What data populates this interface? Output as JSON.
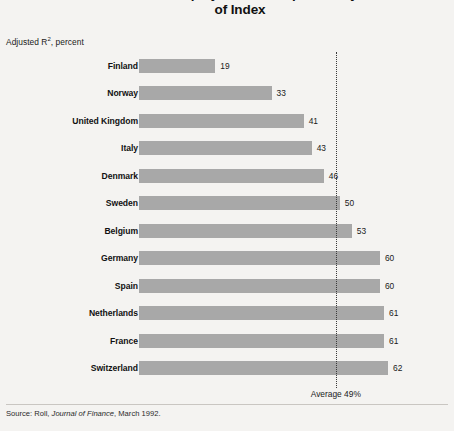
{
  "title": {
    "line1": "Return on Individual Equity Markets Explained by Movements",
    "line2": "of Index"
  },
  "axis_caption": {
    "prefix": "Adjusted R",
    "superscript": "2",
    "suffix": ", percent"
  },
  "average": {
    "label": "Average 49%",
    "value": 49
  },
  "source": {
    "prefix": "Source: Roll, ",
    "italic": "Journal of Finance",
    "suffix": ", March 1992."
  },
  "colors": {
    "background": "#f4f3f1",
    "bar": "#a8a8a8",
    "text": "#1a1a1a",
    "reference_line": "#3a3a3a"
  },
  "chart_data": {
    "type": "bar",
    "orientation": "horizontal",
    "title": "Return on Individual Equity Markets Explained by Movements of Index",
    "xlabel": "Adjusted R2, percent",
    "ylabel": "",
    "xlim": [
      0,
      70
    ],
    "grid": false,
    "legend": false,
    "categories": [
      "Finland",
      "Norway",
      "United Kingdom",
      "Italy",
      "Denmark",
      "Sweden",
      "Belgium",
      "Germany",
      "Spain",
      "Netherlands",
      "France",
      "Switzerland"
    ],
    "values": [
      19,
      33,
      41,
      43,
      46,
      50,
      53,
      60,
      60,
      61,
      61,
      62
    ],
    "value_labels": [
      "19",
      "33",
      "41",
      "43",
      "46",
      "50",
      "53",
      "60",
      "60",
      "61",
      "61",
      "62"
    ],
    "annotations": [
      {
        "text": "Average 49%",
        "type": "reference-line",
        "value": 49
      }
    ]
  }
}
